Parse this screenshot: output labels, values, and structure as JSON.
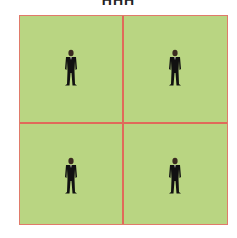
{
  "title": "ННН",
  "colors": {
    "field": "#b9d582",
    "lines": "#e06a5a",
    "figure": "#111111"
  },
  "grid": {
    "rows": 2,
    "cols": 2,
    "cells": [
      {
        "position": "top-left",
        "icon": "person-icon"
      },
      {
        "position": "top-right",
        "icon": "person-icon"
      },
      {
        "position": "bottom-left",
        "icon": "person-icon"
      },
      {
        "position": "bottom-right",
        "icon": "person-icon"
      }
    ]
  }
}
